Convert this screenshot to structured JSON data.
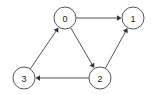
{
  "figure": {
    "width": 156,
    "height": 98,
    "background_color": "#ffffff"
  },
  "style": {
    "node_stroke_color": "#555555",
    "node_fill_color": "#ffffff",
    "node_stroke_width": 1,
    "node_radius": 11,
    "label_color": "#1a1a1a",
    "label_font_size": 9,
    "edge_color": "#555555",
    "edge_width": 1,
    "arrow_color": "#333333",
    "arrow_size": 4.5
  },
  "chart_data": {
    "type": "diagram",
    "diagram_kind": "directed-graph",
    "directed": true,
    "node_count": 4,
    "edge_count": 5,
    "nodes": [
      {
        "id": "0",
        "label": "0",
        "x": 65,
        "y": 18,
        "r": 11
      },
      {
        "id": "1",
        "label": "1",
        "x": 133,
        "y": 18,
        "r": 11
      },
      {
        "id": "2",
        "label": "2",
        "x": 100,
        "y": 78,
        "r": 11
      },
      {
        "id": "3",
        "label": "3",
        "x": 24,
        "y": 78,
        "r": 11
      }
    ],
    "edges": [
      {
        "id": "e0",
        "from": "0",
        "to": "1",
        "label": "0 -> 1",
        "directed": true
      },
      {
        "id": "e1",
        "from": "0",
        "to": "2",
        "label": "0 -> 2",
        "directed": true
      },
      {
        "id": "e2",
        "from": "2",
        "to": "3",
        "label": "2 -> 3",
        "directed": true
      },
      {
        "id": "e3",
        "from": "3",
        "to": "0",
        "label": "3 -> 0",
        "directed": true
      },
      {
        "id": "e4",
        "from": "2",
        "to": "1",
        "label": "2 -> 1",
        "directed": true
      }
    ],
    "adjacency": {
      "0": [
        "1",
        "2"
      ],
      "1": [],
      "2": [
        "3",
        "1"
      ],
      "3": [
        "0"
      ]
    }
  }
}
